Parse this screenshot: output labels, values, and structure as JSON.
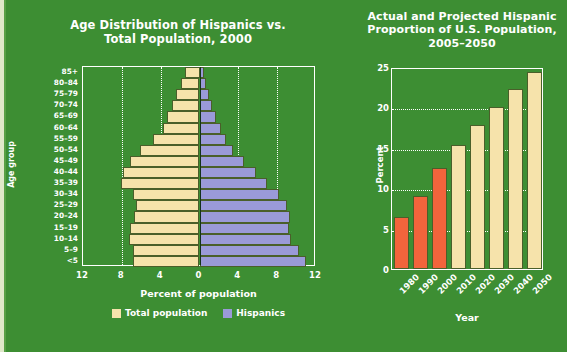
{
  "theme": {
    "background": "#3d8e33",
    "text": "#ffffff",
    "total_population_color": "#f6e3ab",
    "hispanics_color": "#9a9ad8",
    "actual_color": "#f2643c",
    "projected_color": "#f6e3ab",
    "border_color": "#ffffff"
  },
  "chart_data": [
    {
      "id": "age-pyramid",
      "type": "bar",
      "orientation": "horizontal-pyramid",
      "title": "Age Distribution of Hispanics vs.\nTotal Population, 2000",
      "title_line1": "Age Distribution of Hispanics vs.",
      "title_line2": "Total Population, 2000",
      "xlabel": "Percent of population",
      "ylabel": "Age group",
      "xlim": [
        -12,
        12
      ],
      "xticks": [
        12,
        8,
        4,
        0,
        4,
        8,
        12
      ],
      "xtick_values": [
        -12,
        -8,
        -4,
        0,
        4,
        8,
        12
      ],
      "grid": true,
      "legend_position": "bottom",
      "legend": [
        {
          "name": "Total population",
          "color": "#f6e3ab"
        },
        {
          "name": "Hispanics",
          "color": "#9a9ad8"
        }
      ],
      "categories": [
        "85+",
        "80–84",
        "75–79",
        "70–74",
        "65–69",
        "60–64",
        "55–59",
        "50–54",
        "45–49",
        "40–44",
        "35–39",
        "30–34",
        "25–29",
        "20–24",
        "15–19",
        "10–14",
        "5–9",
        "<5"
      ],
      "series": [
        {
          "name": "Total population",
          "color": "#f6e3ab",
          "side": "left",
          "values": [
            1.5,
            1.9,
            2.4,
            2.8,
            3.3,
            3.8,
            4.8,
            6.1,
            7.2,
            7.9,
            8.1,
            6.8,
            6.5,
            6.7,
            7.2,
            7.3,
            6.9,
            6.8
          ]
        },
        {
          "name": "Hispanics",
          "color": "#9a9ad8",
          "side": "right",
          "values": [
            0.5,
            0.7,
            1.0,
            1.3,
            1.7,
            2.2,
            2.7,
            3.5,
            4.6,
            5.8,
            7.0,
            8.2,
            9.0,
            9.3,
            9.2,
            9.4,
            10.2,
            11.0
          ]
        }
      ]
    },
    {
      "id": "hispanic-proportion",
      "type": "bar",
      "orientation": "vertical",
      "title": "Actual and Projected Hispanic\nProportion of U.S. Population,\n2005–2050",
      "title_line1": "Actual and Projected Hispanic",
      "title_line2": "Proportion of U.S. Population,",
      "title_line3": "2005–2050",
      "xlabel": "Year",
      "ylabel": "Percent",
      "ylim": [
        0,
        25
      ],
      "yticks": [
        0,
        5,
        10,
        15,
        20,
        25
      ],
      "grid": true,
      "categories": [
        "1980",
        "1990",
        "2000",
        "2010",
        "2020",
        "2030",
        "2040",
        "2050"
      ],
      "values": [
        6.4,
        9.0,
        12.5,
        15.3,
        17.8,
        20.1,
        22.3,
        24.4
      ],
      "bar_kinds": [
        "actual",
        "actual",
        "actual",
        "projected",
        "projected",
        "projected",
        "projected",
        "projected"
      ],
      "series": [
        {
          "name": "Hispanic proportion of U.S. population",
          "values": [
            6.4,
            9.0,
            12.5,
            15.3,
            17.8,
            20.1,
            22.3,
            24.4
          ]
        }
      ]
    }
  ]
}
